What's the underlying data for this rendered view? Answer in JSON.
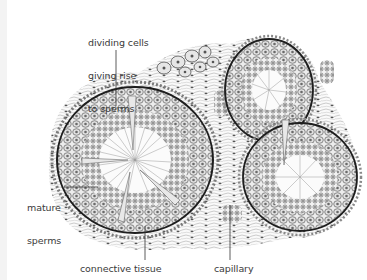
{
  "figure": {
    "labels": {
      "dividing_cells": {
        "line1": "dividing cells",
        "line2": "giving rise",
        "line3": "to sperms"
      },
      "mature_sperms": {
        "line1": "mature",
        "line2": "sperms"
      },
      "connective_tissue": "connective tissue",
      "capillary": "capillary"
    },
    "colors": {
      "background": "#ffffff",
      "ink": "#2a2a2a",
      "cell_fill": "#e2e2e2",
      "label_text": "#3a3a3a",
      "left_strip": "#f3f3f3"
    }
  }
}
